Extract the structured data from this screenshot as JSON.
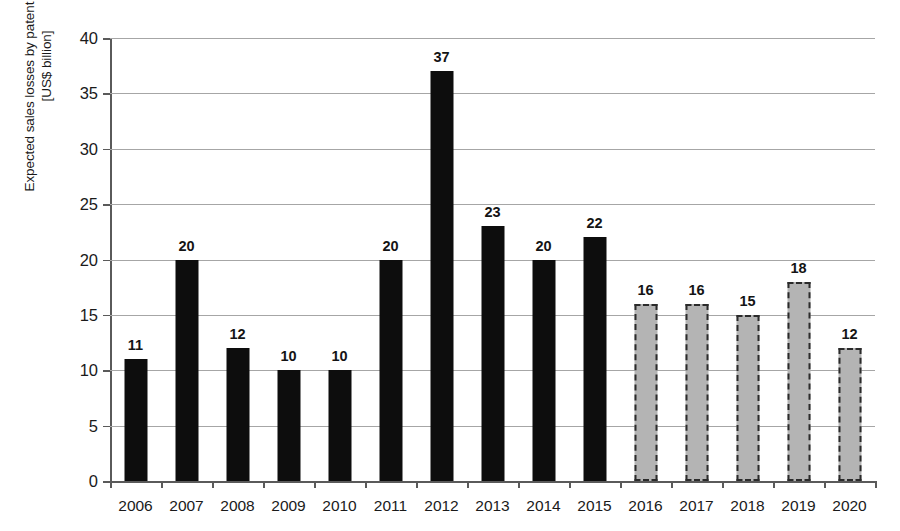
{
  "chart_data": {
    "type": "bar",
    "title": "",
    "xlabel": "",
    "ylabel": "Expected sales losses by patent expiration [US$ billion]",
    "ylabel_lines": [
      "Expected sales losses by patent expiration",
      "[US$ billion]"
    ],
    "ylim": [
      0,
      40
    ],
    "ytick_interval": 5,
    "yticks": [
      "0",
      "5",
      "10",
      "15",
      "20",
      "25",
      "30",
      "35",
      "40"
    ],
    "grid": true,
    "legend": "none",
    "categories": [
      "2006",
      "2007",
      "2008",
      "2009",
      "2010",
      "2011",
      "2012",
      "2013",
      "2014",
      "2015",
      "2016",
      "2017",
      "2018",
      "2019",
      "2020"
    ],
    "values": [
      11,
      20,
      12,
      10,
      10,
      20,
      37,
      23,
      20,
      22,
      16,
      16,
      15,
      18,
      12
    ],
    "data_labels": [
      "11",
      "20",
      "12",
      "10",
      "10",
      "20",
      "37",
      "23",
      "20",
      "22",
      "16",
      "16",
      "15",
      "18",
      "12"
    ],
    "bar_styles": [
      "actual",
      "actual",
      "actual",
      "actual",
      "actual",
      "actual",
      "actual",
      "actual",
      "actual",
      "actual",
      "forecast",
      "forecast",
      "forecast",
      "forecast",
      "forecast"
    ],
    "style_colors": {
      "actual_fill": "#0d0d0d",
      "forecast_fill": "#b4b4b4",
      "forecast_border": "#2b2b2b",
      "gridline": "#a6a6a6",
      "axis": "#5a5a5a",
      "text": "#1a1a1a"
    }
  }
}
